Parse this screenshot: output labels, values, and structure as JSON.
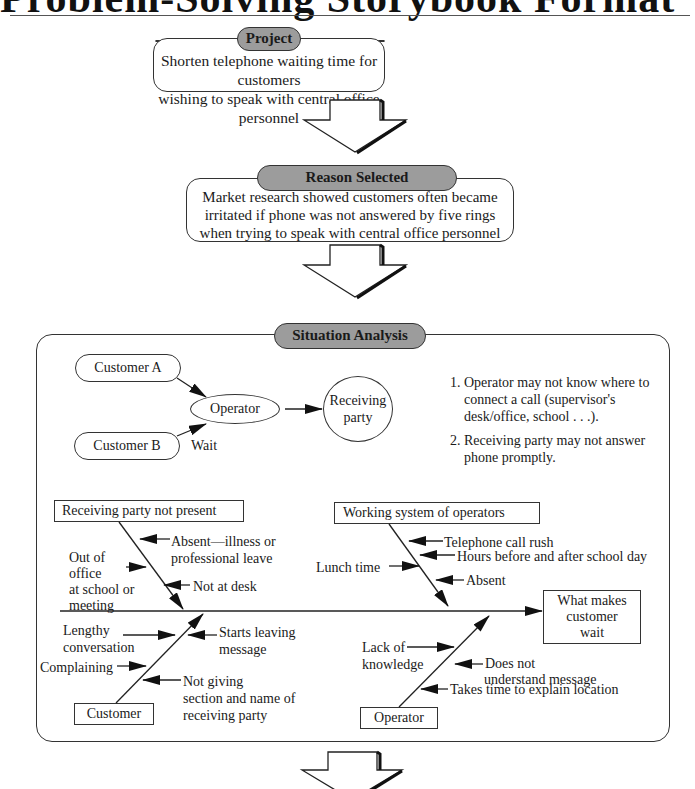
{
  "page": {
    "title": "Problem-Solving Storybook Format"
  },
  "project": {
    "label": "Project",
    "text_lines": [
      "Shorten telephone waiting time for customers",
      "wishing to speak with central office personnel"
    ]
  },
  "reason": {
    "label": "Reason Selected",
    "text_lines": [
      "Market research showed customers often became",
      "irritated if phone was not answered by five rings",
      "when trying to speak with central office personnel"
    ]
  },
  "situation": {
    "label": "Situation Analysis",
    "flow": {
      "customer_a": "Customer A",
      "customer_b": "Customer B",
      "operator": "Operator",
      "wait": "Wait",
      "receiving_party": [
        "Receiving",
        "party"
      ]
    },
    "notes": [
      {
        "num": "1.",
        "lines": [
          "Operator may not know where to",
          "connect a call (supervisor's",
          "desk/office, school . . .)."
        ]
      },
      {
        "num": "2.",
        "lines": [
          "Receiving party may not answer",
          "phone promptly."
        ]
      }
    ],
    "fishbone": {
      "effect": [
        "What makes",
        "customer",
        "wait"
      ],
      "categories": [
        {
          "name": "Receiving party not present",
          "causes": [
            [
              "Absent—illness or",
              "professional leave"
            ],
            [
              "Out of",
              "office",
              "at school or",
              "meeting"
            ],
            [
              "Not at desk"
            ]
          ]
        },
        {
          "name": "Working system of operators",
          "causes": [
            [
              "Telephone call rush"
            ],
            [
              "Lunch time"
            ],
            [
              "Hours before and after school day"
            ],
            [
              "Absent"
            ]
          ]
        },
        {
          "name": "Customer",
          "causes": [
            [
              "Lengthy",
              "conversation"
            ],
            [
              "Starts leaving",
              "message"
            ],
            [
              "Complaining"
            ],
            [
              "Not giving",
              "section and name of",
              "receiving party"
            ]
          ]
        },
        {
          "name": "Operator",
          "causes": [
            [
              "Lack of",
              "knowledge"
            ],
            [
              "Does not",
              "understand message"
            ],
            [
              "Takes time to explain location"
            ]
          ]
        }
      ]
    }
  }
}
